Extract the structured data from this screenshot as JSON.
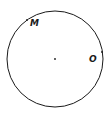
{
  "diagram": {
    "shape": "circle",
    "center": {
      "x": 55,
      "y": 59
    },
    "radius": 48,
    "stroke_color": "#1a1a1a",
    "points": [
      {
        "label": "M",
        "x": 27,
        "y": 20,
        "label_x": 30,
        "label_y": 26
      },
      {
        "label": "O",
        "x": 102,
        "y": 52,
        "label_x": 89,
        "label_y": 62
      }
    ],
    "center_point": {
      "label": "",
      "x": 55,
      "y": 59
    }
  }
}
